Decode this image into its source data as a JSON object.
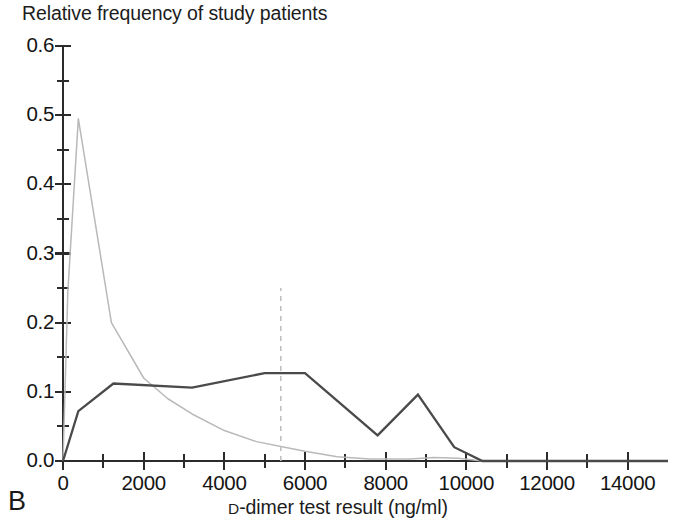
{
  "figure": {
    "panel_label": "B",
    "title": "Relative frequency of study patients",
    "xaxis_title_prefix": "D",
    "xaxis_title_rest": "-dimer test result (ng/ml)"
  },
  "axes": {
    "y_tick_labels": [
      "0.6",
      "0.5",
      "0.4",
      "0.3",
      "0.2",
      "0.1",
      "0.0"
    ],
    "x_tick_labels": [
      "0",
      "2000",
      "4000",
      "6000",
      "8000",
      "10000",
      "12000",
      "14000"
    ]
  },
  "colors": {
    "series_dark": "#4a4a4a",
    "series_light": "#b9b9b9",
    "cutoff": "#c0c0c0",
    "axis": "#2b2b2b",
    "text": "#141414"
  },
  "chart_data": {
    "type": "line",
    "title": "Relative frequency of study patients",
    "xlabel": "D-dimer test result (ng/ml)",
    "ylabel": "Relative frequency of study patients",
    "xlim": [
      0,
      15000
    ],
    "ylim": [
      0.0,
      0.6
    ],
    "xticks": [
      0,
      2000,
      4000,
      6000,
      8000,
      10000,
      12000,
      14000
    ],
    "xticks_minor_step": 1000,
    "yticks": [
      0.0,
      0.1,
      0.2,
      0.3,
      0.4,
      0.5,
      0.6
    ],
    "yticks_minor_step": 0.05,
    "grid": false,
    "legend": "none",
    "annotations": [
      {
        "name": "cutoff-threshold",
        "type": "vertical-dashed-line",
        "x": 5400,
        "y_from": 0.0,
        "y_to": 0.25
      }
    ],
    "series": [
      {
        "name": "patients-with-venous-thromboembolism",
        "style": "solid-dark",
        "color": "#4a4a4a",
        "x": [
          0,
          380,
          1250,
          3200,
          5000,
          6000,
          7800,
          8800,
          9700,
          10400,
          11000,
          15000
        ],
        "values": [
          0.0,
          0.072,
          0.112,
          0.106,
          0.127,
          0.127,
          0.037,
          0.096,
          0.02,
          0.0,
          0.0,
          0.0
        ]
      },
      {
        "name": "patients-without-venous-thromboembolism",
        "style": "solid-light",
        "color": "#b9b9b9",
        "x": [
          0,
          120,
          380,
          1200,
          2000,
          2600,
          3200,
          4000,
          4800,
          5400,
          6000,
          6800,
          7600,
          8600,
          9200,
          9800,
          10400,
          15000
        ],
        "values": [
          0.0,
          0.245,
          0.495,
          0.2,
          0.12,
          0.09,
          0.068,
          0.044,
          0.028,
          0.021,
          0.014,
          0.006,
          0.003,
          0.003,
          0.005,
          0.004,
          0.0,
          0.0
        ]
      }
    ]
  }
}
